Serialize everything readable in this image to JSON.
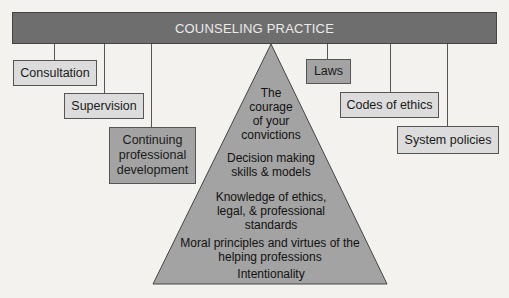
{
  "banner": {
    "title": "COUNSELING PRACTICE"
  },
  "left_boxes": [
    {
      "label": "Consultation"
    },
    {
      "label": "Supervision"
    },
    {
      "label": "Continuing\nprofessional\ndevelopment"
    }
  ],
  "right_boxes": [
    {
      "label": "Laws"
    },
    {
      "label": "Codes of ethics"
    },
    {
      "label": "System policies"
    }
  ],
  "pyramid": {
    "levels": [
      {
        "label": "The courage of your convictions",
        "lines": [
          "The",
          "courage",
          "of your",
          "convictions"
        ]
      },
      {
        "label": "Decision making skills & models",
        "lines": [
          "Decision making",
          "skills & models"
        ]
      },
      {
        "label": "Knowledge of ethics, legal, & professional standards",
        "lines": [
          "Knowledge of ethics,",
          "legal, & professional",
          "standards"
        ]
      },
      {
        "label": "Moral principles and virtues of the helping professions",
        "lines": [
          "Moral principles and virtues of the",
          "helping professions"
        ]
      },
      {
        "label": "Intentionality",
        "lines": [
          "Intentionality"
        ]
      }
    ]
  },
  "colors": {
    "banner": "#6e6e6e",
    "light_box": "#dcdcdc",
    "dark_box": "#a3a3a3",
    "pyramid": "#a3a3a3"
  }
}
